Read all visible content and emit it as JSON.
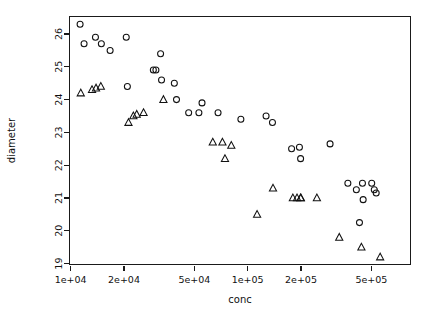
{
  "chart_data": {
    "type": "scatter",
    "title": "",
    "subtitle": "",
    "xlabel": "conc",
    "ylabel": "diameter",
    "xscale": "log",
    "yscale": "linear",
    "grid": false,
    "legend": "none",
    "xlim": [
      9300,
      640000
    ],
    "ylim": [
      18.95,
      26.55
    ],
    "xticks": [
      10000,
      20000,
      50000,
      100000,
      200000,
      500000
    ],
    "xticklabels": [
      "1e+04",
      "2e+04",
      "5e+04",
      "1e+05",
      "2e+05",
      "5e+05"
    ],
    "yticks": [
      19,
      20,
      21,
      22,
      23,
      24,
      25,
      26
    ],
    "yticklabels": [
      "19",
      "20",
      "21",
      "22",
      "23",
      "24",
      "25",
      "26"
    ],
    "series": [
      {
        "name": "circles",
        "marker": "circle",
        "points": [
          [
            11300,
            26.3
          ],
          [
            11900,
            25.7
          ],
          [
            13800,
            25.9
          ],
          [
            14900,
            25.7
          ],
          [
            16700,
            25.5
          ],
          [
            20600,
            25.9
          ],
          [
            20900,
            24.4
          ],
          [
            29300,
            24.9
          ],
          [
            30300,
            24.9
          ],
          [
            32200,
            25.4
          ],
          [
            32600,
            24.6
          ],
          [
            38500,
            24.5
          ],
          [
            39600,
            24.0
          ],
          [
            46400,
            23.6
          ],
          [
            53000,
            23.6
          ],
          [
            55200,
            23.9
          ],
          [
            68000,
            23.6
          ],
          [
            91500,
            23.4
          ],
          [
            127000,
            23.5
          ],
          [
            138000,
            23.3
          ],
          [
            177000,
            22.5
          ],
          [
            196000,
            22.55
          ],
          [
            199000,
            22.2
          ],
          [
            292000,
            22.65
          ],
          [
            368000,
            21.45
          ],
          [
            411000,
            21.25
          ],
          [
            428000,
            20.25
          ],
          [
            445000,
            21.45
          ],
          [
            449000,
            20.95
          ],
          [
            502000,
            21.45
          ],
          [
            519000,
            21.25
          ],
          [
            532000,
            21.15
          ]
        ]
      },
      {
        "name": "triangles",
        "marker": "triangle",
        "points": [
          [
            11400,
            24.2
          ],
          [
            13200,
            24.3
          ],
          [
            13900,
            24.35
          ],
          [
            14800,
            24.4
          ],
          [
            21200,
            23.3
          ],
          [
            22600,
            23.5
          ],
          [
            23600,
            23.55
          ],
          [
            25800,
            23.6
          ],
          [
            33400,
            24.0
          ],
          [
            63500,
            22.7
          ],
          [
            72000,
            22.7
          ],
          [
            74400,
            22.2
          ],
          [
            80800,
            22.6
          ],
          [
            113000,
            20.5
          ],
          [
            139000,
            21.3
          ],
          [
            180000,
            21.0
          ],
          [
            190000,
            21.0
          ],
          [
            199000,
            21.0
          ],
          [
            199800,
            21.0
          ],
          [
            246000,
            21.0
          ],
          [
            329000,
            19.8
          ],
          [
            439000,
            19.5
          ],
          [
            560000,
            19.2
          ]
        ]
      }
    ]
  },
  "axes": {
    "x_title": "conc",
    "y_title": "diameter"
  },
  "colors": {
    "marker_stroke": "#111111",
    "axis": "#1a1a1a",
    "background": "#ffffff"
  }
}
